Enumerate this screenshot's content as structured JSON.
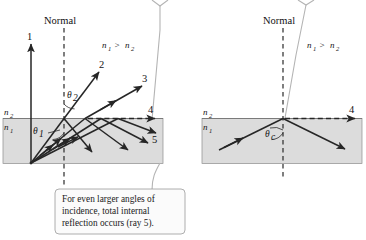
{
  "figure": {
    "background_color": "#ffffff",
    "medium_color": "#dcdcdc",
    "ray_color": "#262626",
    "leader_color": "#b4b4b4"
  },
  "left_panel": {
    "normal_label": "Normal",
    "index_condition": {
      "n1": "n",
      "n1_sub": "1",
      "relation": ">",
      "n2": "n",
      "n2_sub": "2"
    },
    "medium_upper_label": "n",
    "medium_upper_sub": "2",
    "medium_lower_label": "n",
    "medium_lower_sub": "1",
    "angle_incidence_label": "θ",
    "angle_incidence_sub": "1",
    "angle_refraction_label": "θ",
    "angle_refraction_sub": "2",
    "ray_labels": [
      "1",
      "2",
      "3",
      "4",
      "5"
    ]
  },
  "right_panel": {
    "normal_label": "Normal",
    "index_condition": {
      "n1": "n",
      "n1_sub": "1",
      "relation": ">",
      "n2": "n",
      "n2_sub": "2"
    },
    "medium_upper_label": "n",
    "medium_upper_sub": "2",
    "medium_lower_label": "n",
    "medium_lower_sub": "1",
    "angle_critical_label": "θ",
    "angle_critical_sub": "c",
    "ray_labels": [
      "4"
    ]
  },
  "callout": {
    "lines": [
      "For even larger angles of",
      "incidence, total internal",
      "reflection occurs (ray 5)."
    ]
  }
}
